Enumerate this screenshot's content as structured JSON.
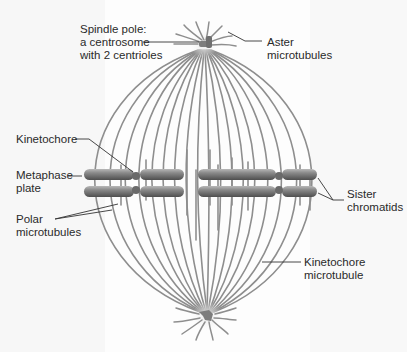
{
  "diagram": {
    "colors": {
      "microtubule": "#8e8e8e",
      "chromosome_dark": "#5a5a5a",
      "chromosome_light": "#b5b5b5",
      "centrosome": "#7d7d7d",
      "leader_line": "#333333",
      "text": "#2a2a2a"
    },
    "labels": {
      "spindle_pole": [
        "Spindle pole:",
        "a centrosome",
        "with 2 centrioles"
      ],
      "aster": [
        "Aster",
        "microtubules"
      ],
      "kinetochore": [
        "Kinetochore"
      ],
      "metaphase_plate": [
        "Metaphase",
        "plate"
      ],
      "sister_chromatids": [
        "Sister",
        "chromatids"
      ],
      "polar_microtubules": [
        "Polar",
        "microtubules"
      ],
      "kinetochore_microtubule": [
        "Kinetochore",
        "microtubule"
      ]
    },
    "components": [
      {
        "name": "top-spindle-pole",
        "x": 204,
        "y": 44
      },
      {
        "name": "bottom-spindle-pole",
        "x": 207,
        "y": 316
      },
      {
        "name": "chromosome-left",
        "centromere_x": 136,
        "y_upper": 175,
        "y_lower": 191
      },
      {
        "name": "chromosome-right",
        "centromere_x": 279,
        "y_upper": 175,
        "y_lower": 191
      }
    ]
  }
}
